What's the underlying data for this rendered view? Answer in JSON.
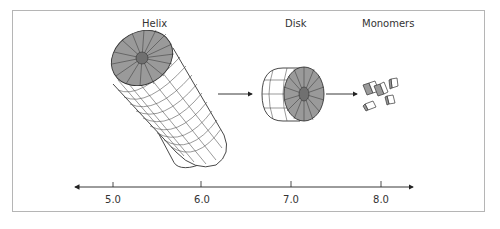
{
  "diagram": {
    "stages": [
      {
        "label": "Helix"
      },
      {
        "label": "Disk"
      },
      {
        "label": "Monomers"
      }
    ],
    "axis": {
      "ticks": [
        "5.0",
        "6.0",
        "7.0",
        "8.0"
      ]
    },
    "colors": {
      "face": "#9a9a9a",
      "center": "#707070",
      "side": "#ffffff",
      "line": "#333333",
      "border": "#b5b5b5"
    }
  }
}
